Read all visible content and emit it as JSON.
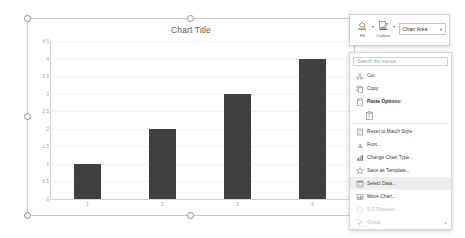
{
  "chart_object": {
    "selected": true,
    "handle_names": [
      "top-left",
      "top-center",
      "top-right",
      "middle-left",
      "middle-right",
      "bottom-left",
      "bottom-center",
      "bottom-right"
    ]
  },
  "chart_data": {
    "type": "bar",
    "title": "Chart Title",
    "categories": [
      "1",
      "2",
      "3",
      "4"
    ],
    "values": [
      1,
      2,
      3,
      4
    ],
    "series": [
      {
        "name": "Series 1",
        "values": [
          1,
          2,
          3,
          4
        ],
        "color": "#404040"
      }
    ],
    "xlabel": "",
    "ylabel": "",
    "ylim": [
      0,
      4.5
    ],
    "ytick_labels": [
      "4.5",
      "4",
      "3.5",
      "3",
      "2.5",
      "2",
      "1.5",
      "1",
      "0.5",
      "0"
    ],
    "ytick_values": [
      4.5,
      4,
      3.5,
      3,
      2.5,
      2,
      1.5,
      1,
      0.5,
      0
    ],
    "grid": true,
    "grid_axis": "y",
    "legend": "none",
    "bar_color": "#404040",
    "title_color": "#595959",
    "tick_color": "#9a9a9a"
  },
  "mini_toolbar": {
    "fill": {
      "label": "Fill",
      "icon": "fill-bucket-icon",
      "caret": "▾"
    },
    "outline": {
      "label": "Outline",
      "icon": "outline-pencil-icon",
      "caret": "▾"
    },
    "element_selector": {
      "value": "Chart Area",
      "arrow": "▾"
    }
  },
  "context_menu": {
    "search": {
      "placeholder": "Search the menus"
    },
    "items": [
      {
        "label": "Cut",
        "icon": "scissors-icon",
        "state": "enabled",
        "hovered": false
      },
      {
        "label": "Copy",
        "icon": "copy-icon",
        "state": "enabled",
        "hovered": false
      },
      {
        "label": "Paste Options:",
        "icon": "paste-icon",
        "state": "header",
        "hovered": false
      },
      {
        "label": "Reset to Match Style",
        "icon": "reset-style-icon",
        "state": "enabled",
        "hovered": false
      },
      {
        "label": "Font...",
        "icon": "font-a-icon",
        "state": "enabled",
        "hovered": false
      },
      {
        "label": "Change Chart Type...",
        "icon": "change-chart-type-icon",
        "state": "enabled",
        "hovered": false
      },
      {
        "label": "Save as Template...",
        "icon": "save-template-icon",
        "state": "enabled",
        "hovered": false
      },
      {
        "label": "Select Data...",
        "icon": "select-data-icon",
        "state": "enabled",
        "hovered": true
      },
      {
        "label": "Move Chart...",
        "icon": "move-chart-icon",
        "state": "enabled",
        "hovered": false
      },
      {
        "label": "3-D Rotation...",
        "icon": "rotation-3d-icon",
        "state": "disabled",
        "hovered": false
      },
      {
        "label": "Group",
        "icon": "group-icon",
        "state": "disabled",
        "hovered": false,
        "submenu": "▸"
      }
    ],
    "paste_button": {
      "name": "paste-keep-source-formatting-button"
    }
  }
}
